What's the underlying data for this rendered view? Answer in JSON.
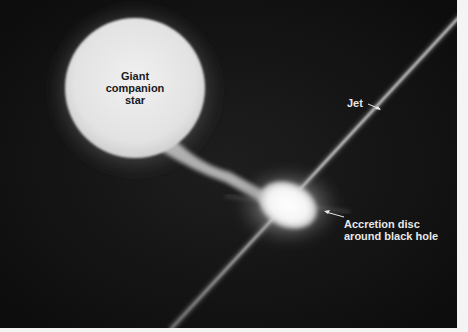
{
  "figure": {
    "labels": {
      "star": [
        "Giant",
        "companion",
        "star"
      ],
      "jet": "Jet",
      "disc": [
        "Accretion disc",
        "around black hole"
      ]
    },
    "colors": {
      "background": "#111111",
      "star": "#e9e9e9",
      "disc_core": "#ffffff",
      "jet": "#cfcfcf",
      "border": "#f4f4f4"
    }
  }
}
